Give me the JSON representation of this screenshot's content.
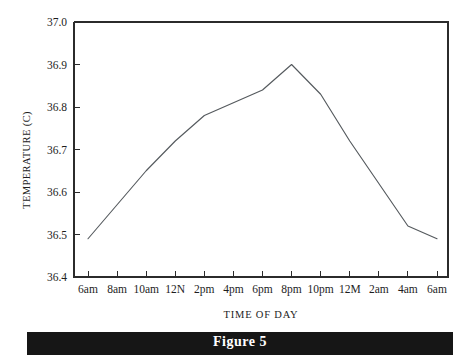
{
  "figure": {
    "caption": "Figure 5"
  },
  "chart_data": {
    "type": "line",
    "title": "",
    "xlabel": "TIME OF DAY",
    "ylabel": "TEMPERATURE (C)",
    "categories": [
      "6am",
      "8am",
      "10am",
      "12N",
      "2pm",
      "4pm",
      "6pm",
      "8pm",
      "10pm",
      "12M",
      "2am",
      "4am",
      "6am"
    ],
    "values": [
      36.49,
      36.57,
      36.65,
      36.72,
      36.78,
      36.81,
      36.84,
      36.9,
      36.83,
      36.72,
      36.62,
      36.52,
      36.49
    ],
    "series": [
      {
        "name": "Body temperature",
        "values": [
          36.49,
          36.57,
          36.65,
          36.72,
          36.78,
          36.81,
          36.84,
          36.9,
          36.83,
          36.72,
          36.62,
          36.52,
          36.49
        ]
      }
    ],
    "ylim": [
      36.4,
      37.0
    ],
    "yticks": [
      "37.0",
      "36.9",
      "36.8",
      "36.7",
      "36.6",
      "36.5",
      "36.4"
    ],
    "ytick_values": [
      37.0,
      36.9,
      36.8,
      36.7,
      36.6,
      36.5,
      36.4
    ],
    "xticks": [
      "6am",
      "8am",
      "10am",
      "12N",
      "2pm",
      "4pm",
      "6pm",
      "8pm",
      "10pm",
      "12M",
      "2am",
      "4am",
      "6am"
    ],
    "grid": false,
    "legend": false,
    "line_color": "#555a5e",
    "axis_color": "#2b2b2b"
  }
}
